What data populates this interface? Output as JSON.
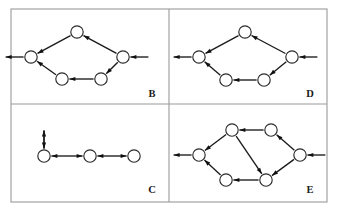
{
  "figure": {
    "title": "",
    "background_color": "#ffffff",
    "frame_color": "#9a9a9a",
    "node_stroke_color": "#2b2b2b",
    "node_fill_color": "#ffffff",
    "edge_color": "#1a1a1a",
    "label_color": "#1a1a1a",
    "frame": {
      "x": 11,
      "y": 9,
      "width": 316,
      "height": 193
    },
    "divider_x": 169,
    "divider_y": 104,
    "node_radius": 6.2,
    "panels": [
      {
        "id": "panel-b",
        "label": "B",
        "label_x": 152,
        "label_y": 97,
        "nodes": [
          {
            "id": "b-left",
            "x": 31,
            "y": 57
          },
          {
            "id": "b-top",
            "x": 77,
            "y": 32
          },
          {
            "id": "b-right",
            "x": 123,
            "y": 57
          },
          {
            "id": "b-botr",
            "x": 101,
            "y": 79
          },
          {
            "id": "b-botl",
            "x": 62,
            "y": 79
          }
        ],
        "edges": [
          {
            "from": "b-top",
            "to": "b-left",
            "type": "directed"
          },
          {
            "from": "b-right",
            "to": "b-top",
            "type": "directed"
          },
          {
            "from": "b-right",
            "to": "b-botr",
            "type": "directed"
          },
          {
            "from": "b-botr",
            "to": "b-botl",
            "type": "directed"
          },
          {
            "from": "b-botl",
            "to": "b-left",
            "type": "directed"
          }
        ],
        "external_edges": [
          {
            "at": "b-left",
            "direction": "out-left",
            "length": 18
          },
          {
            "at": "b-right",
            "direction": "in-left",
            "length": 18
          }
        ]
      },
      {
        "id": "panel-d",
        "label": "D",
        "label_x": 310,
        "label_y": 97,
        "nodes": [
          {
            "id": "d-left",
            "x": 199,
            "y": 57
          },
          {
            "id": "d-top",
            "x": 245,
            "y": 32
          },
          {
            "id": "d-right",
            "x": 292,
            "y": 57
          },
          {
            "id": "d-botr",
            "x": 264,
            "y": 80
          },
          {
            "id": "d-botl",
            "x": 226,
            "y": 80
          }
        ],
        "edges": [
          {
            "from": "d-top",
            "to": "d-left",
            "type": "directed"
          },
          {
            "from": "d-right",
            "to": "d-top",
            "type": "directed"
          },
          {
            "from": "d-right",
            "to": "d-botr",
            "type": "directed"
          },
          {
            "from": "d-botr",
            "to": "d-botl",
            "type": "directed"
          },
          {
            "from": "d-botl",
            "to": "d-left",
            "type": "directed"
          }
        ],
        "external_edges": [
          {
            "at": "d-left",
            "direction": "out-left",
            "length": 18
          },
          {
            "at": "d-right",
            "direction": "in-left",
            "length": 18
          }
        ]
      },
      {
        "id": "panel-c",
        "label": "C",
        "label_x": 152,
        "label_y": 193,
        "nodes": [
          {
            "id": "c-left",
            "x": 44,
            "y": 156
          },
          {
            "id": "c-middle",
            "x": 90,
            "y": 156
          },
          {
            "id": "c-right",
            "x": 134,
            "y": 156
          }
        ],
        "edges": [
          {
            "from": "c-left",
            "to": "c-middle",
            "type": "bidirectional"
          },
          {
            "from": "c-middle",
            "to": "c-right",
            "type": "bidirectional"
          }
        ],
        "external_edges": [
          {
            "at": "c-left",
            "direction": "out-up",
            "length": 18
          },
          {
            "at": "c-left",
            "direction": "in-up",
            "length": 18
          }
        ]
      },
      {
        "id": "panel-e",
        "label": "E",
        "label_x": 310,
        "label_y": 193,
        "nodes": [
          {
            "id": "e-left",
            "x": 199,
            "y": 155
          },
          {
            "id": "e-topl",
            "x": 232,
            "y": 130
          },
          {
            "id": "e-topr",
            "x": 271,
            "y": 130
          },
          {
            "id": "e-right",
            "x": 300,
            "y": 155
          },
          {
            "id": "e-botr",
            "x": 266,
            "y": 180
          },
          {
            "id": "e-botl",
            "x": 226,
            "y": 180
          }
        ],
        "edges": [
          {
            "from": "e-topr",
            "to": "e-topl",
            "type": "directed"
          },
          {
            "from": "e-topl",
            "to": "e-left",
            "type": "directed"
          },
          {
            "from": "e-topl",
            "to": "e-botr",
            "type": "directed"
          },
          {
            "from": "e-right",
            "to": "e-topr",
            "type": "directed"
          },
          {
            "from": "e-right",
            "to": "e-botr",
            "type": "directed"
          },
          {
            "from": "e-botr",
            "to": "e-botl",
            "type": "directed"
          },
          {
            "from": "e-botl",
            "to": "e-left",
            "type": "directed"
          }
        ],
        "external_edges": [
          {
            "at": "e-left",
            "direction": "out-left",
            "length": 18
          },
          {
            "at": "e-right",
            "direction": "in-left",
            "length": 18
          }
        ]
      }
    ]
  }
}
